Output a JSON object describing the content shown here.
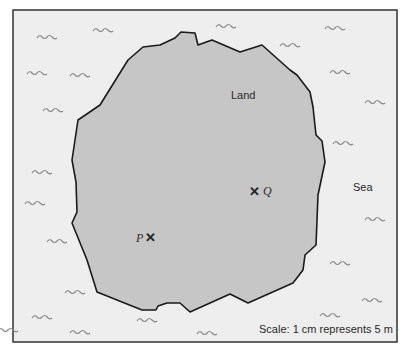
{
  "diagram": {
    "type": "map",
    "frame": {
      "x": 13,
      "y": 10,
      "width": 384,
      "height": 332,
      "fill": "#eeeeee",
      "stroke": "#333333"
    },
    "land": {
      "label": "Land",
      "fill": "#c6c6c6",
      "stroke": "#1a1a1a",
      "outline": "72,223 77,212 76,182 72,160 78,120 100,105 128,60 143,47 160,45 175,38 181,32 195,33 198,45 212,40 240,52 262,45 290,70 297,75 310,92 313,107 316,135 322,141 325,162 318,195 316,245 305,255 303,270 293,283 248,303 230,294 190,312 180,303 167,303 158,306 156,310 142,310 97,292 87,260"
    },
    "sea": {
      "label": "Sea",
      "wave_color": "#8a8a8a"
    },
    "points": [
      {
        "name": "P",
        "label": "P",
        "x": 150,
        "y": 238
      },
      {
        "name": "Q",
        "label": "Q",
        "x": 255,
        "y": 192
      }
    ],
    "scale_text": "Scale: 1 cm represents 5 m",
    "waves": [
      [
        47,
        37
      ],
      [
        103,
        30
      ],
      [
        37,
        73
      ],
      [
        80,
        75
      ],
      [
        53,
        110
      ],
      [
        42,
        172
      ],
      [
        35,
        203
      ],
      [
        57,
        241
      ],
      [
        75,
        292
      ],
      [
        42,
        317
      ],
      [
        80,
        332
      ],
      [
        147,
        320
      ],
      [
        207,
        333
      ],
      [
        226,
        26
      ],
      [
        290,
        45
      ],
      [
        335,
        28
      ],
      [
        340,
        72
      ],
      [
        375,
        102
      ],
      [
        343,
        143
      ],
      [
        375,
        219
      ],
      [
        340,
        263
      ],
      [
        372,
        300
      ],
      [
        330,
        315
      ],
      [
        8,
        330
      ]
    ]
  }
}
